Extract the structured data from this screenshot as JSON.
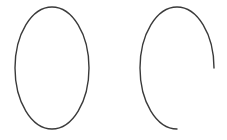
{
  "diagram": {
    "background": "#ffffff",
    "stroke_color": "#3a3a3a",
    "stroke_width": 1.4,
    "shapes": [
      {
        "name": "full-ellipse",
        "type": "ellipse",
        "cx": 52,
        "cy": 68,
        "rx": 37,
        "ry": 61
      },
      {
        "name": "partial-ellipse-arc",
        "type": "arc",
        "cx": 177,
        "cy": 68,
        "rx": 37,
        "ry": 61,
        "start": [
          214,
          68
        ],
        "end": [
          177,
          129
        ],
        "coverage": "three-quarters"
      }
    ]
  }
}
